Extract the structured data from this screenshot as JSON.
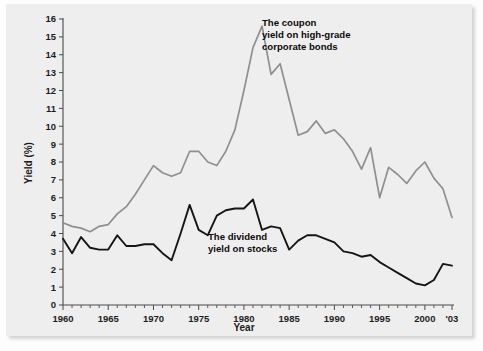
{
  "chart_data": {
    "type": "line",
    "title": "",
    "xlabel": "Year",
    "ylabel": "Yield (%)",
    "xlim": [
      1960,
      2003
    ],
    "ylim": [
      0,
      16
    ],
    "grid": false,
    "legend_position": "inline-annotation",
    "x": [
      1960,
      1961,
      1962,
      1963,
      1964,
      1965,
      1966,
      1967,
      1968,
      1969,
      1970,
      1971,
      1972,
      1973,
      1974,
      1975,
      1976,
      1977,
      1978,
      1979,
      1980,
      1981,
      1982,
      1983,
      1984,
      1985,
      1986,
      1987,
      1988,
      1989,
      1990,
      1991,
      1992,
      1993,
      1994,
      1995,
      1996,
      1997,
      1998,
      1999,
      2000,
      2001,
      2002,
      2003
    ],
    "x_tick_labels": [
      "1960",
      "1965",
      "1970",
      "1975",
      "1980",
      "1985",
      "1990",
      "1995",
      "2000",
      "'03"
    ],
    "x_tick_values": [
      1960,
      1965,
      1970,
      1975,
      1980,
      1985,
      1990,
      1995,
      2000,
      2003
    ],
    "y_tick_labels": [
      "0",
      "1",
      "2",
      "3",
      "4",
      "5",
      "6",
      "7",
      "8",
      "9",
      "10",
      "11",
      "12",
      "13",
      "14",
      "15",
      "16"
    ],
    "y_tick_values": [
      0,
      1,
      2,
      3,
      4,
      5,
      6,
      7,
      8,
      9,
      10,
      11,
      12,
      13,
      14,
      15,
      16
    ],
    "series": [
      {
        "name": "The coupon yield on high-grade corporate bonds",
        "color": "#8f8f8f",
        "values": [
          4.6,
          4.4,
          4.3,
          4.1,
          4.4,
          4.5,
          5.1,
          5.5,
          6.2,
          7.0,
          7.8,
          7.4,
          7.2,
          7.4,
          8.6,
          8.6,
          8.0,
          7.8,
          8.6,
          9.8,
          12.0,
          14.4,
          15.6,
          12.9,
          13.5,
          11.5,
          9.5,
          9.7,
          10.3,
          9.6,
          9.8,
          9.3,
          8.6,
          7.6,
          8.8,
          6.0,
          7.7,
          7.3,
          6.8,
          7.5,
          8.0,
          7.1,
          6.5,
          4.9
        ]
      },
      {
        "name": "The dividend yield on stocks",
        "color": "#151515",
        "values": [
          3.7,
          2.9,
          3.8,
          3.2,
          3.1,
          3.1,
          3.9,
          3.3,
          3.3,
          3.4,
          3.4,
          2.9,
          2.5,
          4.0,
          5.6,
          4.2,
          3.9,
          5.0,
          5.3,
          5.4,
          5.4,
          5.9,
          4.2,
          4.4,
          4.3,
          3.1,
          3.6,
          3.9,
          3.9,
          3.7,
          3.5,
          3.0,
          2.9,
          2.7,
          2.8,
          2.4,
          2.1,
          1.8,
          1.5,
          1.2,
          1.1,
          1.4,
          2.3,
          2.2
        ]
      }
    ],
    "annotations": [
      {
        "id": "bonds-annotation",
        "lines": [
          "The coupon",
          "yield on high-grade",
          "corporate bonds"
        ],
        "x_px": 262,
        "y_px": 26
      },
      {
        "id": "stocks-annotation",
        "lines": [
          "The dividend",
          "yield on stocks"
        ],
        "x_px": 208,
        "y_px": 240
      }
    ]
  }
}
